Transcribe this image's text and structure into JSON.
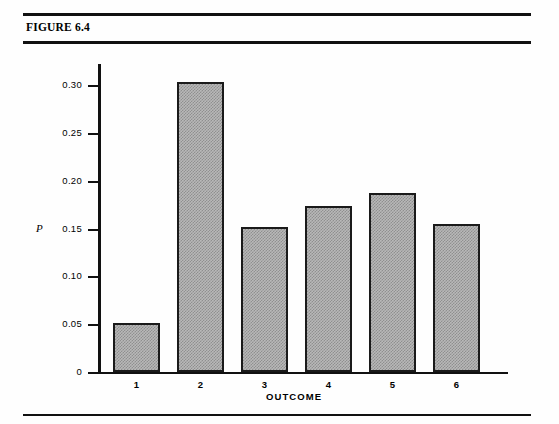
{
  "figure": {
    "title": "FIGURE 6.4"
  },
  "chart_data": {
    "type": "bar",
    "title": "FIGURE 6.4",
    "xlabel": "OUTCOME",
    "ylabel": "P",
    "categories": [
      "1",
      "2",
      "3",
      "4",
      "5",
      "6"
    ],
    "values": [
      0.051,
      0.303,
      0.152,
      0.173,
      0.187,
      0.155
    ],
    "ylim": [
      0,
      0.315
    ],
    "yticks": [
      0,
      0.05,
      0.1,
      0.15,
      0.2,
      0.25,
      0.3
    ],
    "ytick_labels": [
      "0",
      "0.05",
      "0.10",
      "0.15",
      "0.20",
      "0.25",
      "0.30"
    ],
    "grid": false,
    "legend": null,
    "series": [
      {
        "name": "P",
        "values": [
          0.051,
          0.303,
          0.152,
          0.173,
          0.187,
          0.155
        ]
      }
    ],
    "colors": {
      "bar_fill": "#b8b8b8",
      "bar_edge": "#1a1a1a",
      "axis": "#111111",
      "background": "#fefefe"
    }
  }
}
